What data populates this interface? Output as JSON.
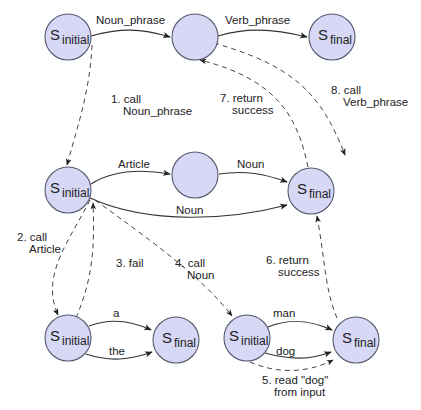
{
  "diagram": {
    "colors": {
      "node_fill": "#d6d8f5",
      "node_stroke": "#555a6e",
      "edge": "#333333"
    },
    "nodes": [
      {
        "id": "np_top_init",
        "symbol": "S",
        "sub": "initial",
        "x": 68,
        "y": 37
      },
      {
        "id": "np_top_mid",
        "symbol": "",
        "sub": "",
        "x": 195,
        "y": 37
      },
      {
        "id": "np_top_final",
        "symbol": "S",
        "sub": "final",
        "x": 332,
        "y": 37
      },
      {
        "id": "np_init",
        "symbol": "S",
        "sub": "initial",
        "x": 68,
        "y": 190
      },
      {
        "id": "np_mid",
        "symbol": "",
        "sub": "",
        "x": 195,
        "y": 175
      },
      {
        "id": "np_final",
        "symbol": "S",
        "sub": "final",
        "x": 311,
        "y": 191
      },
      {
        "id": "art_init",
        "symbol": "S",
        "sub": "initial",
        "x": 68,
        "y": 338
      },
      {
        "id": "art_final",
        "symbol": "S",
        "sub": "final",
        "x": 176,
        "y": 340
      },
      {
        "id": "noun_init",
        "symbol": "S",
        "sub": "initial",
        "x": 247,
        "y": 338
      },
      {
        "id": "noun_final",
        "symbol": "S",
        "sub": "final",
        "x": 356,
        "y": 340
      }
    ],
    "edge_labels": {
      "noun_phrase": "Noun_phrase",
      "verb_phrase": "Verb_phrase",
      "article": "Article",
      "noun_upper": "Noun",
      "noun_lower": "Noun",
      "a": "a",
      "the": "the",
      "man": "man",
      "dog": "dog"
    },
    "steps": {
      "s1_line1": "1. call",
      "s1_line2": "Noun_phrase",
      "s2_line1": "2. call",
      "s2_line2": "Article",
      "s3": "3. fail",
      "s4_line1": "4. call",
      "s4_line2": "Noun",
      "s5_line1": "5. read \"dog\"",
      "s5_line2": "from input",
      "s6_line1": "6. return",
      "s6_line2": "success",
      "s7_line1": "7. return",
      "s7_line2": "success",
      "s8_line1": "8. call",
      "s8_line2": "Verb_phrase"
    },
    "state_text": {
      "s": "S",
      "initial": "initial",
      "final": "final"
    }
  }
}
